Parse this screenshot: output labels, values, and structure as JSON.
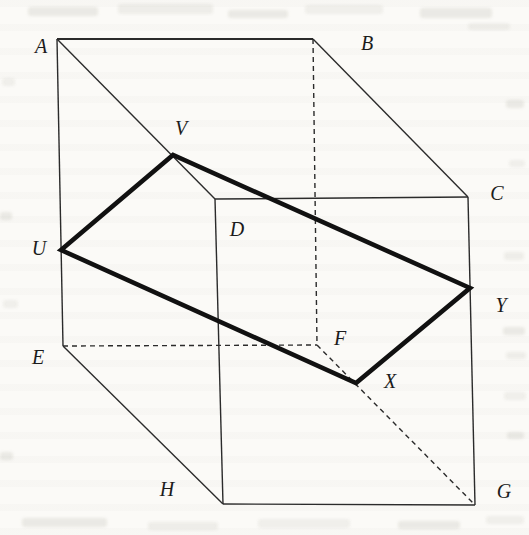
{
  "figure": {
    "colors": {
      "paper": "#fbfaf7",
      "line": "#2b2b2b",
      "bold": "#111111",
      "label": "#1c1c1c"
    },
    "stroke": {
      "thin": 1.4,
      "bold": 4.6,
      "dash": "5,4"
    },
    "vertices": {
      "A": [
        57,
        39
      ],
      "B": [
        313,
        39
      ],
      "C": [
        468,
        197
      ],
      "D": [
        215,
        199
      ],
      "E": [
        63,
        346
      ],
      "F": [
        317,
        345
      ],
      "G": [
        475,
        505
      ],
      "H": [
        223,
        504
      ],
      "U": [
        61,
        250
      ],
      "V": [
        173,
        155
      ],
      "X": [
        356,
        383
      ],
      "Y": [
        470,
        288
      ]
    },
    "edges": [
      {
        "from": "A",
        "to": "B",
        "style": "solid",
        "width": 2
      },
      {
        "from": "B",
        "to": "C",
        "style": "solid"
      },
      {
        "from": "C",
        "to": "G",
        "style": "solid"
      },
      {
        "from": "G",
        "to": "H",
        "style": "solid"
      },
      {
        "from": "H",
        "to": "E",
        "style": "solid"
      },
      {
        "from": "E",
        "to": "A",
        "style": "solid"
      },
      {
        "from": "A",
        "to": "D",
        "style": "solid"
      },
      {
        "from": "D",
        "to": "C",
        "style": "solid"
      },
      {
        "from": "D",
        "to": "H",
        "style": "solid"
      },
      {
        "from": "B",
        "to": "F",
        "style": "dashed"
      },
      {
        "from": "E",
        "to": "F",
        "style": "dashed"
      },
      {
        "from": "F",
        "to": "G",
        "style": "dashed"
      }
    ],
    "section": {
      "points": [
        "U",
        "V",
        "Y",
        "X"
      ],
      "closed": true
    },
    "labels": [
      {
        "text": "A",
        "x": 41,
        "y": 46
      },
      {
        "text": "B",
        "x": 367,
        "y": 43
      },
      {
        "text": "C",
        "x": 497,
        "y": 193
      },
      {
        "text": "D",
        "x": 237,
        "y": 229
      },
      {
        "text": "E",
        "x": 38,
        "y": 357
      },
      {
        "text": "F",
        "x": 340,
        "y": 338
      },
      {
        "text": "G",
        "x": 504,
        "y": 491
      },
      {
        "text": "H",
        "x": 167,
        "y": 489
      },
      {
        "text": "U",
        "x": 39,
        "y": 248
      },
      {
        "text": "V",
        "x": 181,
        "y": 128
      },
      {
        "text": "X",
        "x": 390,
        "y": 381
      },
      {
        "text": "Y",
        "x": 501,
        "y": 305
      }
    ]
  }
}
